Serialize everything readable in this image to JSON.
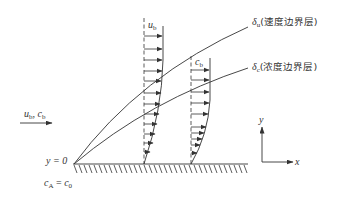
{
  "diagram": {
    "labels": {
      "inflow_u": "u",
      "inflow_u_sub": "b",
      "inflow_sep": ", ",
      "inflow_c": "c",
      "inflow_c_sub": "b",
      "velocity_profile_u": "u",
      "velocity_profile_u_sub": "b",
      "conc_profile_c": "c",
      "conc_profile_c_sub": "b",
      "delta_u_symbol": "δ",
      "delta_u_sub": "u",
      "delta_u_text": "(速度边界层)",
      "delta_c_symbol": "δ",
      "delta_c_sub": "c",
      "delta_c_text": "(浓度边界层)",
      "origin_y": "y = 0",
      "wall_c": "c",
      "wall_c_sub": "A",
      "wall_eq": " = ",
      "wall_c0": "c",
      "wall_c0_sub": "0",
      "axis_y": "y",
      "axis_x": "x"
    },
    "colors": {
      "stroke": "#333333",
      "background": "#ffffff"
    }
  }
}
